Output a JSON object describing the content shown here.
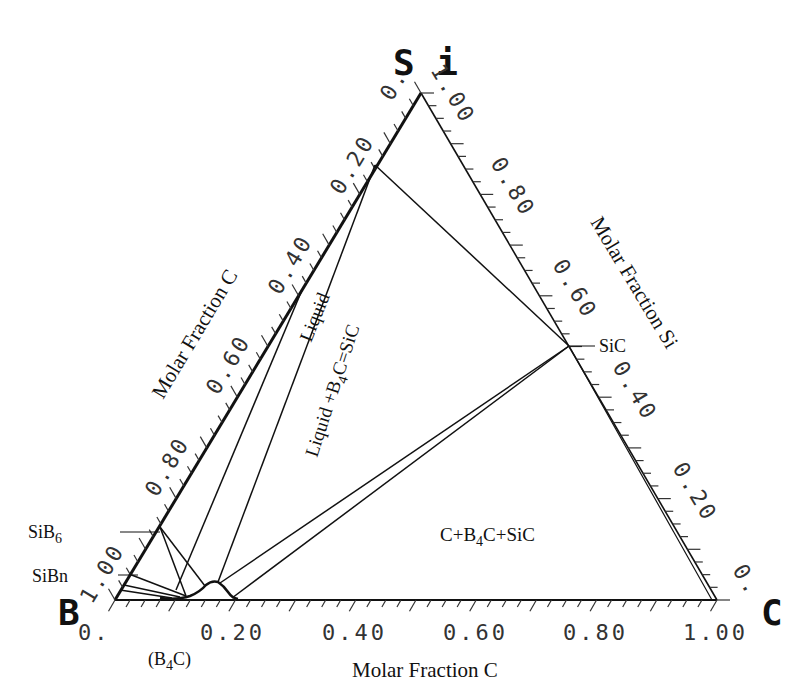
{
  "chart_data": {
    "type": "ternary-phase-diagram",
    "title": "",
    "vertices": {
      "bottom_left": {
        "label": "B",
        "px": [
          115,
          600
        ]
      },
      "bottom_right": {
        "label": "C",
        "px": [
          717,
          600
        ]
      },
      "top": {
        "label": "Si",
        "px": [
          421,
          93
        ]
      }
    },
    "axes": {
      "bottom": {
        "title": "Molar Fraction C",
        "ticks": [
          "0.",
          "0.20",
          "0.40",
          "0.60",
          "0.80",
          "1.00"
        ],
        "values": [
          0,
          0.2,
          0.4,
          0.6,
          0.8,
          1.0
        ]
      },
      "left": {
        "title": "Molar Fraction C",
        "ticks": [
          "0.",
          "0.20",
          "0.40",
          "0.60",
          "0.80",
          "1.00"
        ],
        "values": [
          0,
          0.2,
          0.4,
          0.6,
          0.8,
          1.0
        ]
      },
      "right": {
        "title": "Molar Fraction Si",
        "ticks": [
          "1.00",
          "0.80",
          "0.60",
          "0.40",
          "0.20",
          "0."
        ],
        "values": [
          1.0,
          0.8,
          0.6,
          0.4,
          0.2,
          0
        ]
      }
    },
    "compounds": [
      {
        "name": "SiB6",
        "label_main": "SiB",
        "label_sub": "6"
      },
      {
        "name": "SiBn",
        "label_main": "SiBn",
        "label_sub": ""
      },
      {
        "name": "B4C",
        "label_main": "(B",
        "label_sub": "4",
        "label_tail": "C)"
      },
      {
        "name": "SiC",
        "label_main": "SiC",
        "label_sub": ""
      }
    ],
    "phase_regions": [
      {
        "name": "Liquid",
        "label": "Liquid"
      },
      {
        "name": "Liquid+B4C+SiC",
        "label_main": "Liquid +B",
        "label_sub": "4",
        "label_tail": "C=SiC"
      },
      {
        "name": "C+B4C+SiC",
        "label_main": "C+B",
        "label_sub": "4",
        "label_tail": "C+SiC"
      }
    ],
    "tie_lines_px": [
      [
        [
          375,
          165
        ],
        [
          569,
          346
        ]
      ],
      [
        [
          375,
          165
        ],
        [
          300,
          293
        ]
      ],
      [
        [
          375,
          165
        ],
        [
          218,
          580
        ]
      ],
      [
        [
          300,
          293
        ],
        [
          175,
          590
        ]
      ],
      [
        [
          569,
          346
        ],
        [
          218,
          583
        ]
      ],
      [
        [
          569,
          346
        ],
        [
          232,
          598
        ]
      ],
      [
        [
          565,
          349
        ],
        [
          222,
          585
        ]
      ],
      [
        [
          160,
          527
        ],
        [
          185,
          596
        ]
      ],
      [
        [
          160,
          527
        ],
        [
          205,
          585
        ]
      ],
      [
        [
          126,
          577
        ],
        [
          185,
          596
        ]
      ],
      [
        [
          120,
          590
        ],
        [
          185,
          596
        ]
      ],
      [
        [
          130,
          570
        ],
        [
          200,
          590
        ]
      ]
    ]
  },
  "labels": {
    "vertex_si": "S i",
    "vertex_b": "B",
    "vertex_c": "C",
    "bottom_axis_title": "Molar Fraction C",
    "left_axis_title": "Molar Fraction C",
    "right_axis_title": "Molar Fraction Si",
    "bottom_ticks": [
      "0.",
      "0.20",
      "0.40",
      "0.60",
      "0.80",
      "1.00"
    ],
    "left_ticks": [
      "1.00",
      "0.80",
      "0.60",
      "0.40",
      "0.20",
      "0."
    ],
    "right_ticks": [
      "1.00",
      "0.80",
      "0.60",
      "0.40",
      "0.20",
      "0."
    ],
    "top_tick_1": "1",
    "sib6_main": "SiB",
    "sib6_sub": "6",
    "sibn": "SiBn",
    "b4c_open": "(B",
    "b4c_sub": "4",
    "b4c_close": "C)",
    "sic": "SiC",
    "region_liquid": "Liquid",
    "region_liq_b4c_main": "Liquid +B",
    "region_liq_b4c_sub": "4",
    "region_liq_b4c_tail": "C=SiC",
    "region_c_b4c_main": "C+B",
    "region_c_b4c_sub": "4",
    "region_c_b4c_tail": "C+SiC"
  }
}
